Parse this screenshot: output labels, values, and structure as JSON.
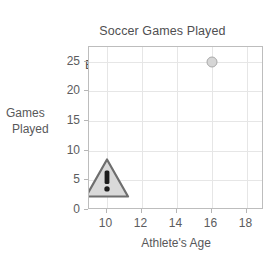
{
  "chart_data": {
    "type": "scatter",
    "title": "Soccer Games Played Each Season by Age",
    "title_line1": "Soccer Games Played",
    "title_line2": "Each Season by Age",
    "xlabel": "Athlete's Age",
    "ylabel": "Games Played",
    "ylabel_line1": "Games",
    "ylabel_line2": "Played",
    "xlim": [
      9,
      19
    ],
    "ylim": [
      0,
      27.5
    ],
    "grid": true,
    "legend": "none",
    "xticks": [
      10,
      12,
      14,
      16,
      18
    ],
    "xtick_labels": [
      "10",
      "12",
      "14",
      "16",
      "18"
    ],
    "yticks": [
      0,
      5,
      10,
      15,
      20,
      25
    ],
    "ytick_labels": [
      "0",
      "5",
      "10",
      "15",
      "20",
      "25"
    ],
    "points": [
      {
        "x": 16,
        "y": 25,
        "marker": "circle"
      }
    ],
    "annotations": [
      {
        "name": "warning-triangle",
        "glyph": "!",
        "x": 10,
        "y": 5,
        "fill": "#d9d9d9",
        "stroke": "#6e6e6e"
      }
    ],
    "colors": {
      "point_fill": "#d6d6d6",
      "point_stroke": "#a9a9a9",
      "grid": "#e6e6e6",
      "axis": "#bdbdbd",
      "text": "#58585a",
      "background": "#ffffff"
    }
  }
}
